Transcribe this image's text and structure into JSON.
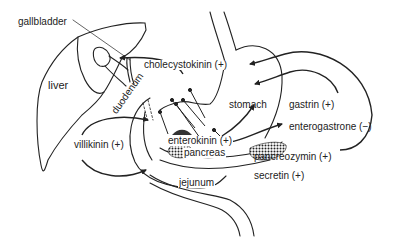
{
  "diagram": {
    "organs": {
      "gallbladder": "gallbladder",
      "liver": "liver",
      "duodenum": "duodenum",
      "stomach": "stomach",
      "pancreas": "pancreas",
      "jejunum": "jejunum"
    },
    "hormones": {
      "cholecystokinin": "cholecystokinin (+)",
      "gastrin": "gastrin (+)",
      "enterogastrone": "enterogastrone (−)",
      "villikinin": "villikinin (+)",
      "enterokinin": "enterokinin (+)",
      "pancreozymin": "pancreozymin (+)",
      "secretin": "secretin (+)"
    },
    "colors": {
      "line": "#222222",
      "background": "#ffffff"
    }
  }
}
